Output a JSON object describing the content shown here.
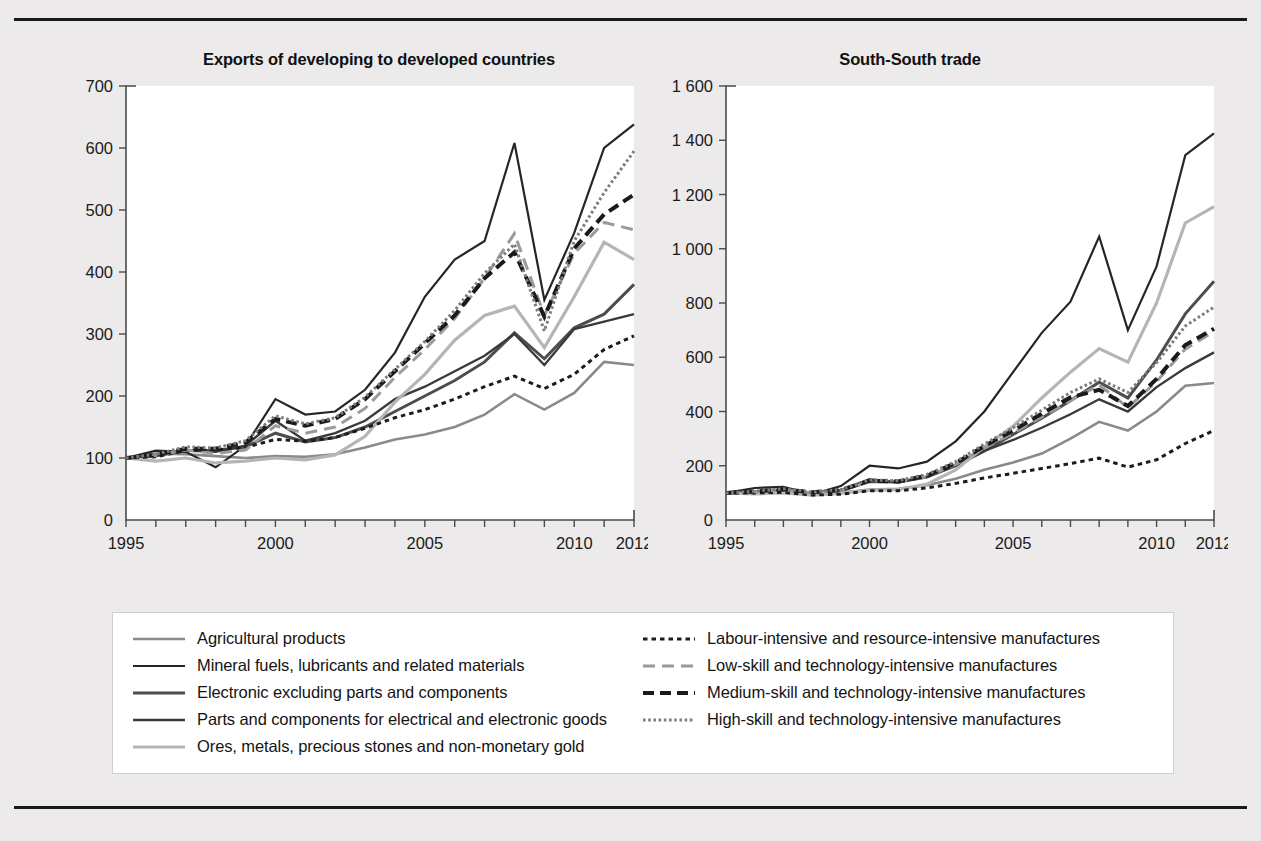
{
  "figure": {
    "panels": [
      {
        "id": "left",
        "title": "Exports of developing to developed countries"
      },
      {
        "id": "right",
        "title": "South-South trade"
      }
    ]
  },
  "legend": {
    "left_column": [
      {
        "label": "Agricultural products",
        "style": "solid-gray"
      },
      {
        "label": "Mineral fuels, lubricants and related materials",
        "style": "solid-black"
      },
      {
        "label": "Electronic excluding parts and components",
        "style": "solid-darkgray-thick"
      },
      {
        "label": "Parts and components for electrical and electronic goods",
        "style": "solid-black-thick"
      },
      {
        "label": "Ores, metals, precious stones and non-monetary gold",
        "style": "solid-lightgray-thick"
      }
    ],
    "right_column": [
      {
        "label": "Labour-intensive and resource-intensive manufactures",
        "style": "dotted-black"
      },
      {
        "label": "Low-skill and technology-intensive manufactures",
        "style": "dashed-gray"
      },
      {
        "label": "Medium-skill and technology-intensive manufactures",
        "style": "dashed-black-thick"
      },
      {
        "label": "High-skill and technology-intensive manufactures",
        "style": "dotted-gray-fine"
      }
    ]
  },
  "colors": {
    "agricultural": "#8a8a8a",
    "mineral_fuels": "#262626",
    "electronic": "#4d4d4d",
    "parts_components": "#3a3a3a",
    "ores_metals": "#b5b5b5",
    "labour_intensive": "#1c1c1c",
    "low_skill": "#9a9a9a",
    "medium_skill": "#1a1a1a",
    "high_skill": "#7d7d7d",
    "axis": "#4a4a4a",
    "text": "#141414",
    "page_background": "#eceaea",
    "plot_background": "#ffffff",
    "rule": "#1a1a1a"
  },
  "chart_data": [
    {
      "type": "line",
      "id": "exports-developing-to-developed",
      "title": "Exports of developing to developed countries",
      "xlabel": "",
      "ylabel": "",
      "grid": false,
      "legend_position": "bottom",
      "x": [
        1995,
        1996,
        1997,
        1998,
        1999,
        2000,
        2001,
        2002,
        2003,
        2004,
        2005,
        2006,
        2007,
        2008,
        2009,
        2010,
        2011,
        2012
      ],
      "xtick_labels": [
        "1995",
        "2000",
        "2005",
        "2010",
        "2012"
      ],
      "xtick_values": [
        1995,
        2000,
        2005,
        2010,
        2012
      ],
      "xlim": [
        1995,
        2012
      ],
      "ylim": [
        0,
        700
      ],
      "ytick_values": [
        0,
        100,
        200,
        300,
        400,
        500,
        600,
        700
      ],
      "ytick_labels": [
        "0",
        "100",
        "200",
        "300",
        "400",
        "500",
        "600",
        "700"
      ],
      "series": [
        {
          "name": "Agricultural products",
          "color_key": "agricultural",
          "style": "solid-gray",
          "values": [
            100,
            107,
            106,
            103,
            100,
            103,
            102,
            106,
            117,
            130,
            138,
            150,
            170,
            203,
            178,
            205,
            255,
            250
          ]
        },
        {
          "name": "Mineral fuels, lubricants and related materials",
          "color_key": "mineral_fuels",
          "style": "solid-black",
          "values": [
            100,
            112,
            110,
            85,
            120,
            195,
            170,
            175,
            210,
            270,
            360,
            420,
            450,
            608,
            355,
            463,
            600,
            638
          ]
        },
        {
          "name": "Electronic excluding parts and components",
          "color_key": "electronic",
          "style": "solid-darkgray-thick",
          "values": [
            100,
            104,
            112,
            112,
            118,
            140,
            126,
            133,
            150,
            175,
            200,
            225,
            255,
            302,
            260,
            310,
            332,
            380
          ]
        },
        {
          "name": "Parts and components for electrical and electronic goods",
          "color_key": "parts_components",
          "style": "solid-black-thick",
          "values": [
            100,
            103,
            112,
            110,
            120,
            160,
            128,
            140,
            160,
            195,
            215,
            240,
            265,
            300,
            250,
            308,
            320,
            332
          ]
        },
        {
          "name": "Ores, metals, precious stones and non-monetary gold",
          "color_key": "ores_metals",
          "style": "solid-lightgray-thick",
          "values": [
            100,
            95,
            100,
            92,
            95,
            100,
            97,
            105,
            135,
            190,
            235,
            290,
            330,
            345,
            278,
            360,
            448,
            420
          ]
        },
        {
          "name": "Labour-intensive and resource-intensive manufactures",
          "color_key": "labour_intensive",
          "style": "dotted-black",
          "values": [
            100,
            102,
            112,
            113,
            117,
            130,
            127,
            133,
            148,
            165,
            178,
            195,
            215,
            232,
            212,
            235,
            275,
            297
          ]
        },
        {
          "name": "Low-skill and technology-intensive manufactures",
          "color_key": "low_skill",
          "style": "dashed-gray",
          "values": [
            100,
            104,
            113,
            107,
            113,
            152,
            140,
            150,
            180,
            230,
            275,
            325,
            390,
            462,
            330,
            430,
            480,
            468
          ]
        },
        {
          "name": "Medium-skill and technology-intensive manufactures",
          "color_key": "medium_skill",
          "style": "dashed-black-thick",
          "values": [
            100,
            105,
            115,
            115,
            125,
            163,
            152,
            163,
            195,
            240,
            285,
            330,
            390,
            432,
            328,
            438,
            493,
            525
          ]
        },
        {
          "name": "High-skill and technology-intensive manufactures",
          "color_key": "high_skill",
          "style": "dotted-gray-fine",
          "values": [
            100,
            106,
            118,
            116,
            128,
            168,
            155,
            165,
            198,
            243,
            288,
            338,
            398,
            445,
            305,
            450,
            528,
            595
          ]
        }
      ]
    },
    {
      "type": "line",
      "id": "south-south-trade",
      "title": "South-South trade",
      "xlabel": "",
      "ylabel": "",
      "grid": false,
      "legend_position": "bottom",
      "x": [
        1995,
        1996,
        1997,
        1998,
        1999,
        2000,
        2001,
        2002,
        2003,
        2004,
        2005,
        2006,
        2007,
        2008,
        2009,
        2010,
        2011,
        2012
      ],
      "xtick_labels": [
        "1995",
        "2000",
        "2005",
        "2010",
        "2012"
      ],
      "xtick_values": [
        1995,
        2000,
        2005,
        2010,
        2012
      ],
      "xlim": [
        1995,
        2012
      ],
      "ylim": [
        0,
        1600
      ],
      "ytick_values": [
        0,
        200,
        400,
        600,
        800,
        1000,
        1200,
        1400,
        1600
      ],
      "ytick_labels": [
        "0",
        "200",
        "400",
        "600",
        "800",
        "1 000",
        "1 200",
        "1 400",
        "1 600"
      ],
      "series": [
        {
          "name": "Agricultural products",
          "color_key": "agricultural",
          "style": "solid-gray",
          "values": [
            100,
            105,
            108,
            100,
            100,
            112,
            115,
            128,
            152,
            185,
            212,
            245,
            300,
            362,
            330,
            400,
            495,
            505
          ]
        },
        {
          "name": "Mineral fuels, lubricants and related materials",
          "color_key": "mineral_fuels",
          "style": "solid-black",
          "values": [
            100,
            118,
            122,
            95,
            125,
            200,
            190,
            215,
            290,
            400,
            545,
            690,
            805,
            1045,
            700,
            935,
            1345,
            1425
          ]
        },
        {
          "name": "Electronic excluding parts and components",
          "color_key": "electronic",
          "style": "solid-darkgray-thick",
          "values": [
            100,
            104,
            110,
            100,
            108,
            142,
            140,
            158,
            200,
            255,
            315,
            375,
            440,
            508,
            450,
            590,
            760,
            880
          ]
        },
        {
          "name": "Parts and components for electrical and electronic goods",
          "color_key": "parts_components",
          "style": "solid-black-thick",
          "values": [
            100,
            103,
            110,
            98,
            110,
            150,
            138,
            160,
            200,
            255,
            295,
            340,
            390,
            445,
            400,
            490,
            560,
            618
          ]
        },
        {
          "name": "Ores, metals, precious stones and non-monetary gold",
          "color_key": "ores_metals",
          "style": "solid-lightgray-thick",
          "values": [
            100,
            96,
            100,
            92,
            98,
            110,
            112,
            132,
            185,
            270,
            345,
            450,
            545,
            632,
            582,
            800,
            1095,
            1155
          ]
        },
        {
          "name": "Labour-intensive and resource-intensive manufactures",
          "color_key": "labour_intensive",
          "style": "dotted-black",
          "values": [
            100,
            100,
            102,
            92,
            95,
            108,
            108,
            118,
            135,
            155,
            172,
            190,
            208,
            228,
            195,
            222,
            282,
            330
          ]
        },
        {
          "name": "Low-skill and technology-intensive manufactures",
          "color_key": "low_skill",
          "style": "dashed-gray",
          "values": [
            100,
            104,
            112,
            100,
            108,
            142,
            140,
            160,
            205,
            265,
            320,
            380,
            440,
            498,
            415,
            510,
            630,
            695
          ]
        },
        {
          "name": "Medium-skill and technology-intensive manufactures",
          "color_key": "medium_skill",
          "style": "dashed-black-thick",
          "values": [
            100,
            105,
            113,
            102,
            110,
            145,
            142,
            163,
            210,
            272,
            330,
            392,
            452,
            480,
            420,
            520,
            645,
            705
          ]
        },
        {
          "name": "High-skill and technology-intensive manufactures",
          "color_key": "high_skill",
          "style": "dotted-gray-fine",
          "values": [
            100,
            106,
            115,
            103,
            112,
            148,
            145,
            168,
            215,
            280,
            340,
            405,
            470,
            520,
            470,
            580,
            715,
            785
          ]
        }
      ]
    }
  ]
}
